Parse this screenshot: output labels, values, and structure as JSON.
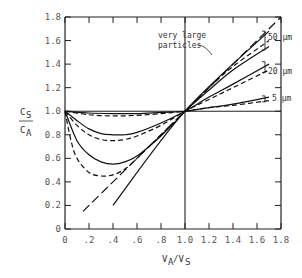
{
  "chart_data": {
    "type": "line",
    "title": "",
    "xlabel": "V_A/V_S",
    "ylabel": "C_S/C_A",
    "xlim": [
      0,
      1.8
    ],
    "ylim": [
      0,
      1.8
    ],
    "grid": false,
    "x_ticks": [
      "0",
      ".2",
      ".4",
      ".6",
      ".8",
      "1.0",
      "1.2",
      "1.4",
      "1.6",
      "1.8"
    ],
    "x_tick_values": [
      0,
      0.2,
      0.4,
      0.6,
      0.8,
      1.0,
      1.2,
      1.4,
      1.6,
      1.8
    ],
    "y_ticks": [
      "0",
      "0.2",
      "0.4",
      "0.6",
      "0.8",
      "1.0",
      "1.2",
      "1.4",
      "1.6",
      "1.8"
    ],
    "y_tick_values": [
      0,
      0.2,
      0.4,
      0.6,
      0.8,
      1.0,
      1.2,
      1.4,
      1.6,
      1.8
    ],
    "reference_lines": [
      {
        "name": "horizontal-unity",
        "axis": "y",
        "value": 1.0
      },
      {
        "name": "vertical-unity",
        "axis": "x",
        "value": 1.0
      }
    ],
    "series": [
      {
        "name": "very large particles (isokinetic ideal)",
        "style": "longdash",
        "x": [
          0.15,
          1.0,
          1.8
        ],
        "y": [
          0.15,
          1.0,
          1.8
        ]
      },
      {
        "name": "very large particles (alt)",
        "style": "solid",
        "x": [
          0.4,
          1.0,
          1.7
        ],
        "y": [
          0.2,
          1.0,
          1.68
        ]
      },
      {
        "name": "50 µm solid",
        "style": "solid",
        "x": [
          0.0,
          0.1,
          0.2,
          0.3,
          0.4,
          0.5,
          0.6,
          0.7,
          0.8,
          0.9,
          1.0,
          1.2,
          1.4,
          1.7
        ],
        "y": [
          1.0,
          0.75,
          0.63,
          0.57,
          0.55,
          0.57,
          0.62,
          0.7,
          0.79,
          0.89,
          1.0,
          1.18,
          1.35,
          1.55
        ]
      },
      {
        "name": "50 µm dashed",
        "style": "dash",
        "x": [
          0.0,
          0.05,
          0.1,
          0.2,
          0.3,
          0.4,
          0.5,
          0.6,
          0.7,
          0.8,
          0.9,
          1.0,
          1.2,
          1.4,
          1.7
        ],
        "y": [
          1.0,
          0.75,
          0.6,
          0.48,
          0.45,
          0.46,
          0.51,
          0.6,
          0.7,
          0.8,
          0.9,
          1.0,
          1.2,
          1.38,
          1.6
        ]
      },
      {
        "name": "20 µm solid",
        "style": "solid",
        "x": [
          0.0,
          0.1,
          0.2,
          0.3,
          0.4,
          0.5,
          0.6,
          0.8,
          1.0,
          1.2,
          1.4,
          1.7
        ],
        "y": [
          1.0,
          0.92,
          0.85,
          0.81,
          0.8,
          0.8,
          0.82,
          0.9,
          1.0,
          1.12,
          1.23,
          1.4
        ]
      },
      {
        "name": "20 µm dashed",
        "style": "dash",
        "x": [
          0.0,
          0.1,
          0.2,
          0.3,
          0.4,
          0.5,
          0.6,
          0.8,
          1.0,
          1.2,
          1.4,
          1.7
        ],
        "y": [
          1.0,
          0.88,
          0.8,
          0.76,
          0.75,
          0.76,
          0.79,
          0.88,
          1.0,
          1.1,
          1.2,
          1.35
        ]
      },
      {
        "name": "5 µm solid",
        "style": "solid",
        "x": [
          0.0,
          0.2,
          0.4,
          0.6,
          0.8,
          1.0,
          1.2,
          1.4,
          1.7
        ],
        "y": [
          1.0,
          0.985,
          0.98,
          0.98,
          0.99,
          1.0,
          1.03,
          1.06,
          1.12
        ]
      },
      {
        "name": "5 µm dashed",
        "style": "dash",
        "x": [
          0.0,
          0.2,
          0.4,
          0.6,
          0.8,
          1.0,
          1.2,
          1.4,
          1.7
        ],
        "y": [
          1.0,
          0.97,
          0.96,
          0.965,
          0.98,
          1.0,
          1.03,
          1.05,
          1.09
        ]
      }
    ],
    "annotations": [
      {
        "text_line1": "very large",
        "text_line2": "particles",
        "points_to": "very large particles"
      },
      {
        "text": "50 µm",
        "group": "50 µm"
      },
      {
        "text": "20 µm",
        "group": "20 µm"
      },
      {
        "text": "5 µm",
        "group": "5 µm"
      }
    ],
    "y_label_top": "C",
    "y_label_top_sub": "S",
    "y_label_bottom": "C",
    "y_label_bottom_sub": "A",
    "x_label_main1": "V",
    "x_label_sub1": "A",
    "x_label_slash": "/V",
    "x_label_sub2": "S"
  }
}
